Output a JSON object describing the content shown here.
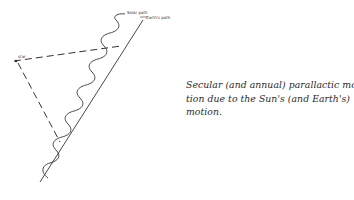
{
  "figure": {
    "labels": {
      "solar_path": "Solar path",
      "earth_path": "Earth's path",
      "star": "star"
    },
    "caption_lines": [
      "Secular (and annual) parallactic mo-",
      "tion due to the Sun's (and Earth's)",
      "motion."
    ],
    "colors": {
      "ink": "#2a2a2a",
      "background": "#ffffff"
    }
  }
}
